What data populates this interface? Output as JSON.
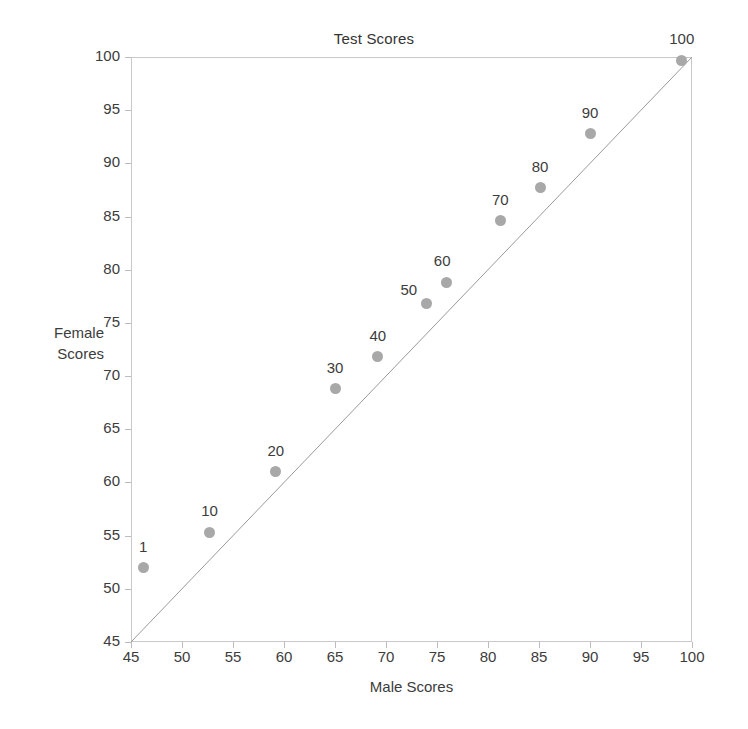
{
  "chart_data": {
    "type": "scatter",
    "title": "Test Scores",
    "xlabel": "Male Scores",
    "ylabel": "Female Scores",
    "ylabel_line1": "Female",
    "ylabel_line2": "Scores",
    "xlim": [
      45,
      100
    ],
    "ylim": [
      45,
      100
    ],
    "xticks": [
      45,
      50,
      55,
      60,
      65,
      70,
      75,
      80,
      85,
      90,
      95,
      100
    ],
    "yticks": [
      45,
      50,
      55,
      60,
      65,
      70,
      75,
      80,
      85,
      90,
      95,
      100
    ],
    "grid": false,
    "legend": "none",
    "marker_color": "#a8a8a8",
    "line_color": "#9a9a9a",
    "axis_color": "#c9c9c9",
    "annotations": [
      {
        "text": "reference line y = x",
        "x0": 45,
        "y0": 45,
        "x1": 100,
        "y1": 100
      }
    ],
    "series": [
      {
        "name": "Percentile points",
        "points": [
          {
            "label": "1",
            "x": 46.2,
            "y": 52.0,
            "label_dx": 0,
            "label_dy": -13
          },
          {
            "label": "10",
            "x": 52.7,
            "y": 55.3,
            "label_dx": 0,
            "label_dy": -13
          },
          {
            "label": "20",
            "x": 59.2,
            "y": 61.0,
            "label_dx": 0,
            "label_dy": -13
          },
          {
            "label": "30",
            "x": 65.0,
            "y": 68.8,
            "label_dx": 0,
            "label_dy": -13
          },
          {
            "label": "40",
            "x": 69.2,
            "y": 71.8,
            "label_dx": 0,
            "label_dy": -13
          },
          {
            "label": "50",
            "x": 74.0,
            "y": 76.8,
            "label_dx": -18,
            "label_dy": -6
          },
          {
            "label": "60",
            "x": 75.9,
            "y": 78.8,
            "label_dx": -4,
            "label_dy": -13
          },
          {
            "label": "70",
            "x": 81.2,
            "y": 84.6,
            "label_dx": 0,
            "label_dy": -13
          },
          {
            "label": "80",
            "x": 85.1,
            "y": 87.7,
            "label_dx": 0,
            "label_dy": -13
          },
          {
            "label": "90",
            "x": 90.0,
            "y": 92.8,
            "label_dx": 0,
            "label_dy": -13
          },
          {
            "label": "100",
            "x": 99.0,
            "y": 99.7,
            "label_dx": 0,
            "label_dy": -13
          }
        ]
      }
    ]
  }
}
